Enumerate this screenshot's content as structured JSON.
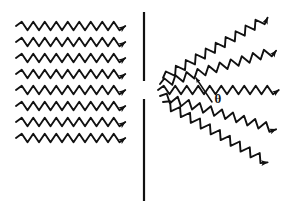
{
  "figure": {
    "width": 287,
    "height": 214,
    "background_color": "#ffffff",
    "ink_color": "#111111"
  },
  "incident_waves": {
    "label": "Incident plane waves travelling to the right",
    "count": 8,
    "direction": "left-to-right",
    "angle_deg": 0,
    "x_start": 16,
    "x_end": 128,
    "y_values": [
      26,
      42,
      58,
      74,
      90,
      106,
      122,
      138
    ],
    "wavelength_px": 11.5,
    "amplitude_px": 4.2,
    "stroke_width": 1.9,
    "arrow_size_px": 7.5
  },
  "barrier": {
    "label": "Opaque barrier with single slit",
    "x": 144,
    "stroke_width": 2.2,
    "segments": [
      {
        "name": "upper-barrier",
        "y_top": 12,
        "y_bottom": 81
      },
      {
        "name": "lower-barrier",
        "y_top": 99,
        "y_bottom": 201
      }
    ],
    "slit": {
      "name": "slit-gap",
      "y_top": 81,
      "y_bottom": 99,
      "width_px": 18
    }
  },
  "diffracted_waves": {
    "label": "Diffracted circular wavefronts fanning out from the slit",
    "count": 5,
    "origin": {
      "x": 160,
      "y": 90
    },
    "wavelength_px": 11.5,
    "amplitude_px": 4.2,
    "stroke_width": 1.9,
    "arrow_size_px": 7.5,
    "rays": [
      {
        "name": "ray-up-30",
        "angle_deg": -30,
        "x_start": 163,
        "y_start": 78,
        "x_end": 277,
        "y_end": 42,
        "length_px": 120
      },
      {
        "name": "ray-up-15",
        "angle_deg": -16,
        "x_start": 160,
        "y_start": 84,
        "x_end": 277,
        "y_end": 60,
        "length_px": 120
      },
      {
        "name": "ray-center",
        "angle_deg": 0,
        "x_start": 158,
        "y_start": 90,
        "x_end": 277,
        "y_end": 82,
        "length_px": 120
      },
      {
        "name": "ray-down-15",
        "angle_deg": 16,
        "x_start": 160,
        "y_start": 96,
        "x_end": 277,
        "y_end": 106,
        "length_px": 120
      },
      {
        "name": "ray-down-30",
        "angle_deg": 30,
        "x_start": 163,
        "y_start": 102,
        "x_end": 277,
        "y_end": 128,
        "length_px": 120
      }
    ]
  },
  "angle_annotation": {
    "name": "diffraction-angle",
    "symbol": "θ",
    "font_size_px": 13,
    "label_x": 218,
    "label_y": 100,
    "leader_line": {
      "x_start": 212,
      "y_start": 102,
      "x_end": 196,
      "y_end": 78
    },
    "description": "Angle theta between the central axis and a diffracted ray"
  }
}
